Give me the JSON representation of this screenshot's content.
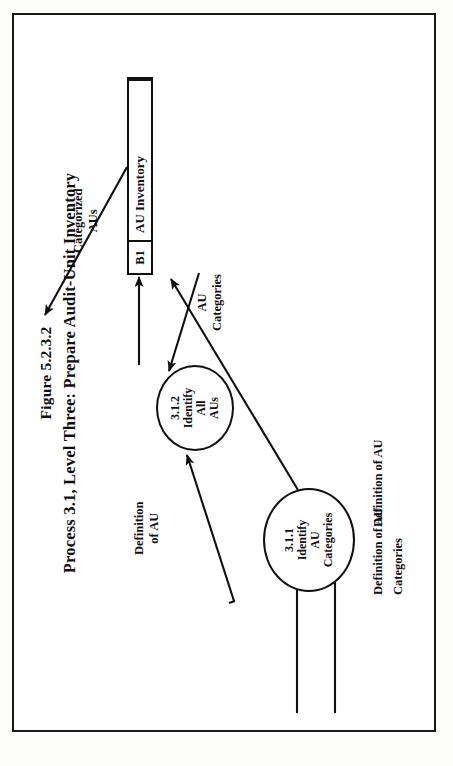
{
  "page": {
    "background_color": "#fdfdfc",
    "frame_color": "#1a1a1a"
  },
  "figure": {
    "title_line_1": "Figure 5.2.3.2",
    "title_line_2": "Process 3.1, Level Three: Prepare Audit-Unit Inventory",
    "orientation": "landscape-rotated-90-ccw",
    "diagram_type": "data-flow-diagram"
  },
  "processes": [
    {
      "id": "3.1.2",
      "number": "3.1.2",
      "lines": [
        "3.1.2",
        "Identify",
        "All",
        "AUs"
      ]
    },
    {
      "id": "3.1.1",
      "number": "3.1.1",
      "lines": [
        "3.1.1",
        "Identify",
        "AU",
        "Categories"
      ]
    }
  ],
  "datastore": {
    "id": "B1",
    "label": "AU Inventory"
  },
  "flows": [
    {
      "name": "definition-of-au-to-312",
      "label_lines": [
        "Definition",
        "of AU"
      ],
      "from": "external",
      "to": "3.1.2"
    },
    {
      "name": "categorized-aus-out",
      "label_lines": [
        "Categorized",
        "AUs"
      ],
      "from": "B1",
      "to": "external"
    },
    {
      "name": "au-categories-to-312",
      "label_lines": [
        "AU",
        "Categories"
      ],
      "from": "B1",
      "to": "3.1.2"
    },
    {
      "name": "312-to-b1",
      "label_lines": [],
      "from": "3.1.2",
      "to": "B1"
    },
    {
      "name": "311-to-b1",
      "label_lines": [],
      "from": "3.1.1",
      "to": "B1"
    },
    {
      "name": "definition-of-au-categories-in",
      "label_lines": [
        "Definition of AU",
        "Categories"
      ],
      "from": "external",
      "to": "3.1.1"
    },
    {
      "name": "definition-of-au-in",
      "label_lines": [
        "Definition of AU"
      ],
      "from": "external",
      "to": "3.1.1"
    }
  ],
  "colors": {
    "ink": "#0d0d0d",
    "line": "#101010",
    "paper": "#ffffff"
  }
}
